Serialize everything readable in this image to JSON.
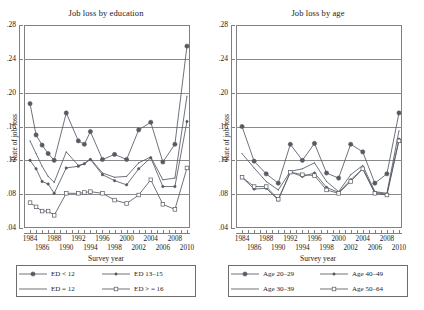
{
  "figure": {
    "background": "#ffffff",
    "series_color": "#555a63",
    "grid_color": "#8a8a8a",
    "frame_color": "#808080"
  },
  "panels": [
    {
      "id": "education",
      "title": "Job loss by education",
      "ylabel": "Rate of job loss",
      "xlabel": "Survey year",
      "legend": [
        {
          "label": "ED < 12",
          "marker": "filled-circle-large"
        },
        {
          "label": "ED = 12",
          "marker": "thin-line"
        },
        {
          "label": "ED 13–15",
          "marker": "filled-dot-small"
        },
        {
          "label": "ED > = 16",
          "marker": "open-circle"
        }
      ]
    },
    {
      "id": "age",
      "title": "Job loss by age",
      "ylabel": "Rate of job loss",
      "xlabel": "Survey year",
      "legend": [
        {
          "label": "Age 20–29",
          "marker": "filled-circle-large"
        },
        {
          "label": "Age 30–39",
          "marker": "thin-line"
        },
        {
          "label": "Age 40–49",
          "marker": "filled-dot-small"
        },
        {
          "label": "Age 50–64",
          "marker": "open-circle"
        }
      ]
    }
  ],
  "chart_data": [
    {
      "type": "line",
      "title": "Job loss by education",
      "xlabel": "Survey year",
      "ylabel": "Rate of job loss",
      "xlim": [
        1983,
        2010.5
      ],
      "ylim": [
        0.04,
        0.28
      ],
      "yticks": [
        0.04,
        0.08,
        0.12,
        0.16,
        0.2,
        0.24,
        0.28
      ],
      "yticklabels": [
        ".04",
        ".08",
        ".12",
        ".16",
        ".20",
        ".24",
        ".28"
      ],
      "xticks": [
        1984,
        1985,
        1986,
        1987,
        1988,
        1989,
        1990,
        1991,
        1992,
        1993,
        1994,
        1995,
        1996,
        1997,
        1998,
        1999,
        2000,
        2001,
        2002,
        2003,
        2004,
        2005,
        2006,
        2007,
        2008,
        2009,
        2010
      ],
      "xticklabels_top": [
        "1984",
        "1988",
        "1992",
        "1996",
        "2000",
        "2004",
        "2008"
      ],
      "xticklabels_bottom": [
        "1986",
        "1990",
        "1994",
        "1998",
        "2002",
        "2006",
        "2010"
      ],
      "grid": "horizontal",
      "legend_position": "below",
      "x": [
        1984,
        1985,
        1986,
        1987,
        1988,
        1990,
        1992,
        1993,
        1994,
        1996,
        1998,
        2000,
        2002,
        2004,
        2006,
        2008,
        2010
      ],
      "series": [
        {
          "name": "ED < 12",
          "marker": "filled-circle-large",
          "values": [
            0.187,
            0.15,
            0.138,
            0.128,
            0.12,
            0.176,
            0.143,
            0.139,
            0.154,
            0.121,
            0.127,
            0.121,
            0.156,
            0.165,
            0.118,
            0.139,
            0.255
          ]
        },
        {
          "name": "ED = 12",
          "marker": "thin-line",
          "values": [
            0.143,
            0.128,
            0.113,
            0.101,
            0.094,
            0.13,
            0.114,
            0.116,
            0.122,
            0.105,
            0.1,
            0.101,
            0.117,
            0.124,
            0.097,
            0.099,
            0.196
          ]
        },
        {
          "name": "ED 13–15",
          "marker": "filled-dot-small",
          "values": [
            0.12,
            0.11,
            0.095,
            0.092,
            0.081,
            0.111,
            0.113,
            0.116,
            0.121,
            0.103,
            0.096,
            0.091,
            0.11,
            0.123,
            0.089,
            0.089,
            0.166
          ]
        },
        {
          "name": "ED > = 16",
          "marker": "open-circle",
          "values": [
            0.07,
            0.065,
            0.06,
            0.06,
            0.055,
            0.081,
            0.081,
            0.082,
            0.083,
            0.081,
            0.073,
            0.069,
            0.079,
            0.097,
            0.068,
            0.062,
            0.111
          ]
        }
      ]
    },
    {
      "type": "line",
      "title": "Job loss by age",
      "xlabel": "Survey year",
      "ylabel": "Rate of job loss",
      "xlim": [
        1983,
        2010.5
      ],
      "ylim": [
        0.04,
        0.28
      ],
      "yticks": [
        0.04,
        0.08,
        0.12,
        0.16,
        0.2,
        0.24,
        0.28
      ],
      "yticklabels": [
        ".04",
        ".08",
        ".12",
        ".16",
        ".20",
        ".24",
        ".28"
      ],
      "xticks": [
        1984,
        1985,
        1986,
        1987,
        1988,
        1989,
        1990,
        1991,
        1992,
        1993,
        1994,
        1995,
        1996,
        1997,
        1998,
        1999,
        2000,
        2001,
        2002,
        2003,
        2004,
        2005,
        2006,
        2007,
        2008,
        2009,
        2010
      ],
      "xticklabels_top": [
        "1984",
        "1988",
        "1992",
        "1996",
        "2000",
        "2004",
        "2008"
      ],
      "xticklabels_bottom": [
        "1986",
        "1990",
        "1994",
        "1998",
        "2002",
        "2006",
        "2010"
      ],
      "grid": "horizontal",
      "legend_position": "below",
      "x": [
        1984,
        1986,
        1988,
        1990,
        1992,
        1994,
        1996,
        1998,
        2000,
        2002,
        2004,
        2006,
        2008,
        2010
      ],
      "series": [
        {
          "name": "Age 20–29",
          "marker": "filled-circle-large",
          "values": [
            0.16,
            0.119,
            0.104,
            0.093,
            0.139,
            0.12,
            0.14,
            0.105,
            0.099,
            0.139,
            0.13,
            0.093,
            0.104,
            0.176
          ]
        },
        {
          "name": "Age 30–39",
          "marker": "thin-line",
          "values": [
            0.128,
            0.111,
            0.095,
            0.085,
            0.107,
            0.11,
            0.117,
            0.095,
            0.083,
            0.103,
            0.114,
            0.083,
            0.081,
            0.155
          ]
        },
        {
          "name": "Age 40–49",
          "marker": "filled-dot-small",
          "values": [
            0.1,
            0.086,
            0.087,
            0.073,
            0.106,
            0.101,
            0.105,
            0.088,
            0.082,
            0.097,
            0.11,
            0.082,
            0.08,
            0.145
          ]
        },
        {
          "name": "Age 50–64",
          "marker": "open-circle",
          "values": [
            0.1,
            0.089,
            0.089,
            0.074,
            0.106,
            0.103,
            0.102,
            0.085,
            0.081,
            0.095,
            0.11,
            0.081,
            0.079,
            0.143
          ]
        }
      ]
    }
  ]
}
